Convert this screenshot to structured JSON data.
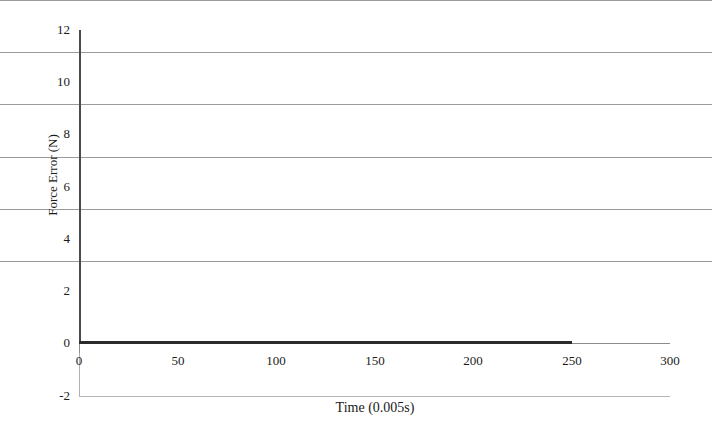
{
  "chart_data": {
    "type": "line",
    "title": "",
    "xlabel": "Time (0.005s)",
    "ylabel": "Force Error (N)",
    "xlim": [
      0,
      300
    ],
    "ylim": [
      -2,
      12
    ],
    "grid": true,
    "legend": null,
    "x_ticks": [
      {
        "value": 0,
        "label": "0"
      },
      {
        "value": 50,
        "label": "50"
      },
      {
        "value": 100,
        "label": "100"
      },
      {
        "value": 150,
        "label": "150"
      },
      {
        "value": 200,
        "label": "200"
      },
      {
        "value": 250,
        "label": "250"
      },
      {
        "value": 300,
        "label": "300"
      }
    ],
    "y_ticks": [
      {
        "value": 12,
        "label": "12"
      },
      {
        "value": 10,
        "label": "10"
      },
      {
        "value": 8,
        "label": "8"
      },
      {
        "value": 6,
        "label": "6"
      },
      {
        "value": 4,
        "label": "4"
      },
      {
        "value": 2,
        "label": "2"
      },
      {
        "value": 0,
        "label": "0"
      },
      {
        "value": -2,
        "label": "-2"
      }
    ],
    "series": [
      {
        "name": "Force Error",
        "color": "#2b2b2b",
        "x": [
          0,
          25,
          50,
          75,
          100,
          125,
          150,
          175,
          200,
          225,
          250
        ],
        "values": [
          0,
          0,
          0,
          0,
          0,
          0,
          0,
          0,
          0,
          0,
          0
        ]
      }
    ],
    "colors": {
      "series_line": "#2b2b2b",
      "gridline": "#9a9a9a",
      "axis": "#4a4a4a",
      "background": "#ffffff",
      "text": "#1a1a1a"
    }
  }
}
